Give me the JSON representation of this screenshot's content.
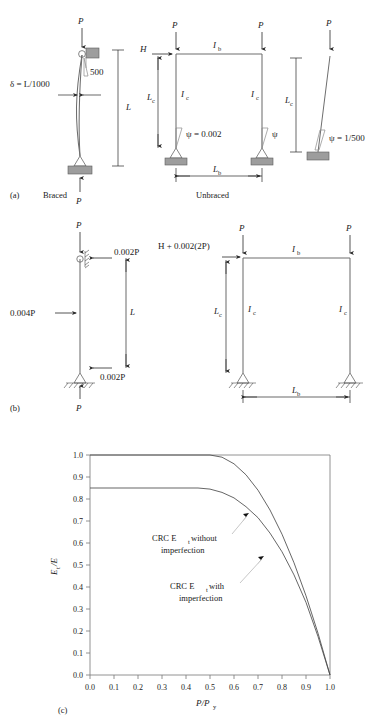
{
  "figure": {
    "panels": [
      {
        "id": "a",
        "tag": "(a)",
        "captions": [
          "Braced",
          "Unbraced"
        ]
      },
      {
        "id": "b",
        "tag": "(b)",
        "captions": []
      },
      {
        "id": "c",
        "tag": "(c)",
        "captions": []
      }
    ]
  },
  "panel_a": {
    "tag": "(a)",
    "braced_caption": "Braced",
    "unbraced_caption": "Unbraced",
    "braced_column": {
      "top_load": "P",
      "bottom_load": "P",
      "imperfection_label": "δ = L/1000",
      "slope_label": "500",
      "length_label": "L"
    },
    "unbraced_frame": {
      "left_load": "P",
      "right_load": "P",
      "lateral_load": "H",
      "beam_inertia": "I",
      "beam_inertia_sub": "b",
      "column_inertia": "I",
      "column_inertia_sub": "c",
      "column_height": "L",
      "column_height_sub": "c",
      "beam_span": "L",
      "beam_span_sub": "b",
      "psi_left": "ψ = 0.002",
      "psi_right": "ψ"
    },
    "unbraced_column": {
      "top_load": "P",
      "height_label": "L",
      "height_sub": "c",
      "psi_label": "ψ = 1/500"
    }
  },
  "panel_b": {
    "tag": "(b)",
    "braced_column": {
      "top_load": "P",
      "bottom_load": "P",
      "top_notional": "0.002P",
      "mid_notional": "0.004P",
      "bottom_notional": "0.002P",
      "length_label": "L"
    },
    "unbraced_frame": {
      "left_load": "P",
      "right_load": "P",
      "lateral_load": "H + 0.002(2P)",
      "beam_inertia": "I",
      "beam_inertia_sub": "b",
      "column_inertia": "I",
      "column_inertia_sub": "c",
      "column_height": "L",
      "column_height_sub": "c",
      "beam_span": "L",
      "beam_span_sub": "b"
    }
  },
  "chart_data": {
    "type": "line",
    "tag": "(c)",
    "title": "",
    "xlabel": "P/P",
    "xlabel_sub": "y",
    "ylabel": "E",
    "ylabel_sub": "t",
    "ylabel_rest": "/E",
    "xlim": [
      0.0,
      1.0
    ],
    "ylim": [
      0.0,
      1.0
    ],
    "grid": false,
    "legend_position": "inline-annotation",
    "xticks": [
      "0.0",
      "0.1",
      "0.2",
      "0.3",
      "0.4",
      "0.5",
      "0.6",
      "0.7",
      "0.8",
      "0.9",
      "1.0"
    ],
    "yticks": [
      "0.0",
      "0.1",
      "0.2",
      "0.3",
      "0.4",
      "0.5",
      "0.6",
      "0.7",
      "0.8",
      "0.9",
      "1.0"
    ],
    "x": [
      0.0,
      0.05,
      0.1,
      0.15,
      0.2,
      0.25,
      0.3,
      0.35,
      0.4,
      0.45,
      0.5,
      0.55,
      0.6,
      0.65,
      0.7,
      0.75,
      0.8,
      0.85,
      0.9,
      0.95,
      1.0
    ],
    "series": [
      {
        "name": "CRC Et without imperfection",
        "annotation": [
          "CRC E",
          "t",
          " without",
          "imperfection"
        ],
        "values": [
          1.0,
          1.0,
          1.0,
          1.0,
          1.0,
          1.0,
          1.0,
          1.0,
          1.0,
          1.0,
          1.0,
          0.99,
          0.96,
          0.91,
          0.84,
          0.75,
          0.64,
          0.51,
          0.36,
          0.19,
          0.0
        ]
      },
      {
        "name": "CRC Et with imperfection",
        "annotation": [
          "CRC E",
          "t",
          " with",
          "imperfection"
        ],
        "values": [
          0.85,
          0.85,
          0.85,
          0.85,
          0.85,
          0.85,
          0.85,
          0.85,
          0.85,
          0.85,
          0.845,
          0.83,
          0.805,
          0.765,
          0.715,
          0.645,
          0.56,
          0.455,
          0.33,
          0.175,
          0.0
        ]
      }
    ],
    "annotations": [
      {
        "text": "CRC Et without imperfection",
        "points_to_series": 0
      },
      {
        "text": "CRC Et with imperfection",
        "points_to_series": 1
      }
    ]
  },
  "colors": {
    "member": "#6e6e6e",
    "curve": "#4a4a4a",
    "axis": "#777777",
    "support_block": "#9d9d9d",
    "text": "#1a1a1a"
  }
}
